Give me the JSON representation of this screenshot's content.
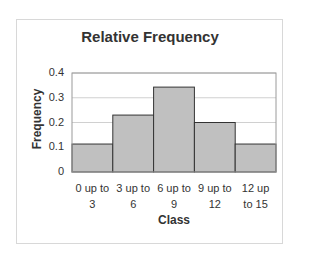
{
  "chart_data": {
    "type": "bar",
    "title": "Relative Frequency",
    "xlabel": "Class",
    "ylabel": "Frequency",
    "categories": [
      "0 up to 3",
      "3 up to 6",
      "6 up to 9",
      "9 up to 12",
      "12 up to 15"
    ],
    "category_lines": [
      [
        "0 up to",
        "3"
      ],
      [
        "3 up to",
        "6"
      ],
      [
        "6 up to",
        "9"
      ],
      [
        "9 up to",
        "12"
      ],
      [
        "12 up",
        "to 15"
      ]
    ],
    "values": [
      0.113,
      0.23,
      0.343,
      0.2,
      0.113
    ],
    "ylim": [
      0,
      0.4
    ],
    "yticks": [
      "0",
      "0.1",
      "0.2",
      "0.3",
      "0.4"
    ],
    "grid": true,
    "legend": "none",
    "bar_color": "#c0c0c0",
    "bar_edge_color": "#333333"
  }
}
